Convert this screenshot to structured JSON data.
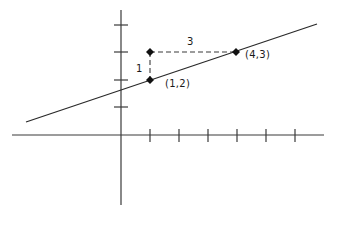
{
  "diagram": {
    "title": "",
    "colors": {
      "stroke": "#3a3a3a",
      "point": "#111111",
      "text": "#1a1a1a",
      "background": "#ffffff"
    },
    "axes": {
      "x_ticks": [
        1,
        2,
        3,
        4,
        5,
        6
      ],
      "y_ticks": [
        1,
        2,
        3,
        4
      ]
    },
    "points": [
      {
        "label": "(1,2)",
        "x": 1,
        "y": 2
      },
      {
        "label": "(4,3)",
        "x": 4,
        "y": 3
      },
      {
        "label": "",
        "x": 1,
        "y": 3
      }
    ],
    "annotations": {
      "rise": "1",
      "run": "3"
    }
  }
}
